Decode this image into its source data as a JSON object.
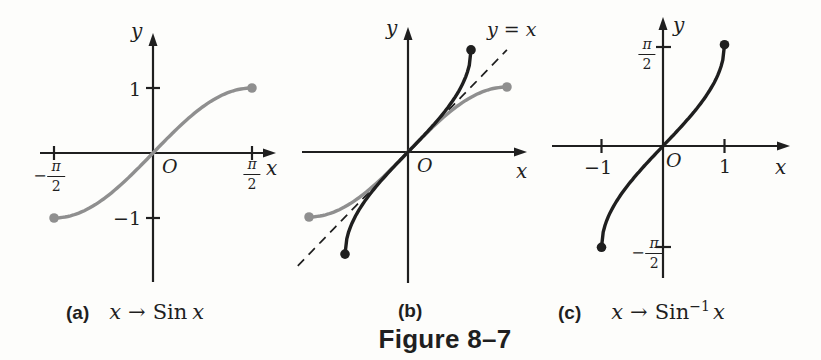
{
  "colors": {
    "ink": "#1f1f1f",
    "gray": "#8f8f8f",
    "background": "#fdfdfb"
  },
  "figure": {
    "caption": "Figure 8–7"
  },
  "panels": {
    "a": {
      "label": "(a)",
      "axis": {
        "x": "x",
        "y": "y",
        "origin": "O"
      },
      "ticks": {
        "y_pos": "1",
        "y_neg": "−1",
        "x_neg": {
          "sign": "−",
          "num": "π",
          "den": "2"
        },
        "x_pos": {
          "num": "π",
          "den": "2"
        }
      },
      "map": {
        "var": "x",
        "arrow": "→",
        "fn": "Sin",
        "arg": "x"
      }
    },
    "b": {
      "label": "(b)",
      "axis": {
        "x": "x",
        "y": "y",
        "origin": "O"
      },
      "line_label": "y = x"
    },
    "c": {
      "label": "(c)",
      "axis": {
        "x": "x",
        "y": "y",
        "origin": "O"
      },
      "ticks": {
        "x_neg": "−1",
        "x_pos": "1",
        "y_pos": {
          "num": "π",
          "den": "2"
        },
        "y_neg": {
          "sign": "−",
          "num": "π",
          "den": "2"
        }
      },
      "map": {
        "var": "x",
        "arrow": "→",
        "fn": "Sin",
        "sup": "−1",
        "arg": "x"
      }
    }
  },
  "chart_data": [
    {
      "id": "a",
      "type": "line",
      "title": "(a) x → Sin x",
      "xlabel": "x",
      "ylabel": "y",
      "origin": "O",
      "grid": false,
      "legend": false,
      "xlim": [
        -1.8,
        1.85
      ],
      "ylim": [
        -2.0,
        1.85
      ],
      "x_ticks": [
        {
          "value": -1.5708,
          "label": "−π/2"
        },
        {
          "value": 1.5708,
          "label": "π/2"
        }
      ],
      "y_ticks": [
        {
          "value": -1,
          "label": "−1"
        },
        {
          "value": 1,
          "label": "1"
        }
      ],
      "series": [
        {
          "name": "y = Sin x",
          "fn": "sin",
          "color": "#8f8f8f",
          "domain": [
            -1.5708,
            1.5708
          ],
          "endpoint_dots": true,
          "points": [
            [
              -1.5708,
              -1
            ],
            [
              -1.1781,
              -0.9239
            ],
            [
              -0.7854,
              -0.7071
            ],
            [
              -0.3927,
              -0.3827
            ],
            [
              0,
              0
            ],
            [
              0.3927,
              0.3827
            ],
            [
              0.7854,
              0.7071
            ],
            [
              1.1781,
              0.9239
            ],
            [
              1.5708,
              1
            ]
          ]
        }
      ]
    },
    {
      "id": "b",
      "type": "line",
      "title": "(b)",
      "xlabel": "x",
      "ylabel": "y",
      "origin": "O",
      "grid": false,
      "legend": false,
      "xlim": [
        -1.7,
        1.9
      ],
      "ylim": [
        -1.9,
        1.95
      ],
      "reference_line": {
        "label": "y = x",
        "fn": "identity",
        "domain": [
          -1.75,
          1.57
        ],
        "style": "dashed",
        "color": "#1f1f1f"
      },
      "series": [
        {
          "name": "y = Sin x",
          "fn": "sin",
          "color": "#8f8f8f",
          "domain": [
            -1.5708,
            1.5708
          ],
          "endpoint_dots": true,
          "points": [
            [
              -1.5708,
              -1
            ],
            [
              -0.7854,
              -0.7071
            ],
            [
              0,
              0
            ],
            [
              0.7854,
              0.7071
            ],
            [
              1.5708,
              1
            ]
          ]
        },
        {
          "name": "y = Sin⁻¹ x",
          "fn": "arcsin",
          "color": "#1f1f1f",
          "domain": [
            -1,
            1
          ],
          "endpoint_dots": true,
          "points": [
            [
              -1,
              -1.5708
            ],
            [
              -0.7071,
              -0.7854
            ],
            [
              0,
              0
            ],
            [
              0.7071,
              0.7854
            ],
            [
              1,
              1.5708
            ]
          ]
        }
      ]
    },
    {
      "id": "c",
      "type": "line",
      "title": "(c) x → Sin⁻¹ x",
      "xlabel": "x",
      "ylabel": "y",
      "origin": "O",
      "grid": false,
      "legend": false,
      "xlim": [
        -1.8,
        2.05
      ],
      "ylim": [
        -1.8,
        2.0
      ],
      "x_ticks": [
        {
          "value": -1,
          "label": "−1"
        },
        {
          "value": 1,
          "label": "1"
        }
      ],
      "y_ticks": [
        {
          "value": -1.5708,
          "label": "−π/2"
        },
        {
          "value": 1.5708,
          "label": "π/2"
        }
      ],
      "series": [
        {
          "name": "y = Sin⁻¹ x",
          "fn": "arcsin",
          "color": "#1f1f1f",
          "domain": [
            -1,
            1
          ],
          "endpoint_dots": true,
          "points": [
            [
              -1,
              -1.5708
            ],
            [
              -0.9239,
              -1.1781
            ],
            [
              -0.7071,
              -0.7854
            ],
            [
              -0.3827,
              -0.3927
            ],
            [
              0,
              0
            ],
            [
              0.3827,
              0.3927
            ],
            [
              0.7071,
              0.7854
            ],
            [
              0.9239,
              1.1781
            ],
            [
              1,
              1.5708
            ]
          ]
        }
      ]
    }
  ]
}
